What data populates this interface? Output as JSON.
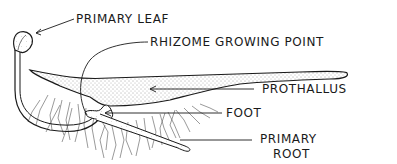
{
  "diagram": {
    "colors": {
      "ink": "#1a1a1a",
      "stipple_fill": "#d9d9d9",
      "background": "#ffffff"
    },
    "labels": [
      {
        "id": "primary-leaf",
        "text": "PRIMARY LEAF"
      },
      {
        "id": "rhizome-growing-point",
        "text": "RHIZOME GROWING POINT"
      },
      {
        "id": "prothallus",
        "text": "PROTHALLUS"
      },
      {
        "id": "foot",
        "text": "FOOT"
      },
      {
        "id": "primary-root",
        "text": "PRIMARY",
        "text2": "ROOT"
      }
    ]
  }
}
